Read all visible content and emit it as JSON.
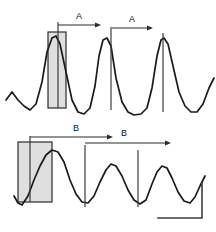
{
  "figure": {
    "background_color": "#ffffff",
    "trace_color": "#1a1a1a",
    "box_fill_color": "#d9d9d9",
    "box_stroke_color": "#2b2b2b",
    "marker_color": "#3c3c3c",
    "width": 216,
    "height": 232
  },
  "panels": [
    {
      "id": "top-panel",
      "name": "upper-trace-panel",
      "interval_label": "A",
      "intervals": [
        {
          "label": "A",
          "label_x": 79,
          "label_y": 19,
          "x1": 58,
          "x2": 101,
          "y": 25
        },
        {
          "label": "A",
          "label_x": 132,
          "label_y": 22,
          "x1": 112,
          "x2": 153,
          "y": 28
        }
      ],
      "highlight_box": {
        "x": 48,
        "y": 32,
        "width": 18,
        "height": 76
      },
      "markers": [
        {
          "x": 58,
          "y1": 22,
          "y2": 108
        },
        {
          "x": 111,
          "y1": 27,
          "y2": 110
        },
        {
          "x": 163,
          "y1": 33,
          "y2": 112
        }
      ]
    },
    {
      "id": "bottom-panel",
      "name": "lower-trace-panel",
      "interval_label": "B",
      "intervals": [
        {
          "label": "B",
          "label_x": 76,
          "label_y": 131,
          "x1": 30,
          "x2": 113,
          "y": 137
        },
        {
          "label": "B",
          "label_x": 124,
          "label_y": 136,
          "x1": 85,
          "x2": 171,
          "y": 143
        }
      ],
      "highlight_box": {
        "x": 18,
        "y": 142,
        "width": 34,
        "height": 60
      },
      "markers": [
        {
          "x": 30,
          "y1": 136,
          "y2": 202
        },
        {
          "x": 85,
          "y1": 145,
          "y2": 207
        },
        {
          "x": 138,
          "y1": 150,
          "y2": 207
        }
      ]
    }
  ],
  "scale_bar": {
    "name": "scale-bar",
    "corner_x": 202,
    "corner_y": 218,
    "horizontal_start_x": 158,
    "vertical_start_y": 183,
    "x_label": "",
    "y_label": ""
  },
  "chart_data": {
    "type": "line",
    "title": "",
    "xlabel": "",
    "ylabel": "",
    "grid": false,
    "legend": "none",
    "series": [
      {
        "name": "upper-trace",
        "path": "M 6 100 L 12 92 L 18 100 L 24 106 L 30 110 L 36 104 L 42 82 L 47 52 L 52 38 L 56 36 L 60 44 L 66 72 L 72 100 L 78 112 L 84 114 L 90 108 L 95 86 L 99 56 L 103 40 L 107 38 L 111 46 L 116 78 L 122 102 L 128 112 L 134 115 L 141 114 L 147 108 L 152 88 L 157 56 L 161 40 L 164 38 L 168 44 L 173 66 L 179 92 L 185 106 L 191 112 L 197 112 L 203 104 L 209 88 L 214 78"
      },
      {
        "name": "lower-trace",
        "path": "M 14 196 L 18 203 L 22 205 L 28 196 L 34 180 L 40 166 L 46 155 L 52 150 L 58 152 L 64 162 L 70 180 L 76 194 L 82 202 L 88 203 L 94 196 L 100 182 L 106 170 L 111 164 L 116 166 L 122 176 L 128 190 L 134 200 L 140 204 L 146 200 L 152 184 L 157 172 L 162 166 L 167 168 L 172 178 L 178 192 L 184 201 L 190 203 L 195 197 L 200 186 L 205 176"
      }
    ]
  }
}
